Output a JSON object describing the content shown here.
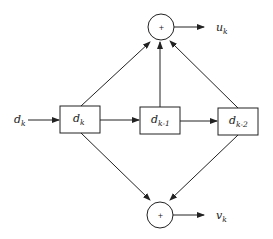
{
  "diagram": {
    "type": "convolutional-encoder",
    "input": {
      "label": "d",
      "sub": "k"
    },
    "registers": [
      {
        "label": "d",
        "sub": "k"
      },
      {
        "label": "d",
        "sub": "k-1"
      },
      {
        "label": "d",
        "sub": "k-2"
      }
    ],
    "adders": [
      {
        "symbol": "+",
        "output": {
          "label": "u",
          "sub": "k"
        },
        "inputs": [
          "d_k",
          "d_k-1",
          "d_k-2"
        ]
      },
      {
        "symbol": "+",
        "output": {
          "label": "v",
          "sub": "k"
        },
        "inputs": [
          "d_k",
          "d_k-2"
        ]
      }
    ],
    "colors": {
      "stroke": "#222222",
      "background": "#ffffff"
    }
  }
}
